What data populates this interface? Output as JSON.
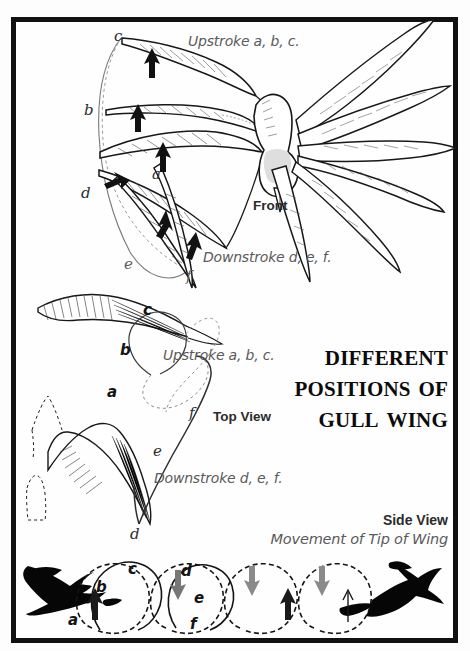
{
  "figure": {
    "title_lines": [
      "Different",
      "Positions of",
      "Gull Wing"
    ],
    "panels": [
      {
        "id": "front",
        "view_label": "Front",
        "upstroke_caption": "Upstroke a, b, c.",
        "downstroke_caption": "Downstroke d, e, f.",
        "markers": [
          "c",
          "b",
          "d",
          "a",
          "e",
          "f"
        ]
      },
      {
        "id": "top",
        "view_label": "Top View",
        "upstroke_caption": "Upstroke a, b, c.",
        "downstroke_caption": "Downstroke d, e, f.",
        "markers": [
          "c",
          "b",
          "a",
          "f",
          "e",
          "d"
        ]
      },
      {
        "id": "side",
        "view_label": "Side View",
        "sub_caption": "Movement of Tip of Wing",
        "markers": [
          "a",
          "b",
          "c",
          "d",
          "e",
          "f"
        ]
      }
    ]
  },
  "labels": {
    "upstroke_top": "Upstroke a, b, c.",
    "downstroke_top": "Downstroke d, e, f.",
    "front": "Front",
    "upstroke_mid": "Upstroke a, b, c.",
    "topview": "Top View",
    "downstroke_mid": "Downstroke d, e, f.",
    "sideview": "Side View",
    "movement": "Movement of Tip of Wing"
  },
  "markers": {
    "p1_c": "c",
    "p1_b": "b",
    "p1_d": "d",
    "p1_a": "a",
    "p1_e": "e",
    "p1_f": "f",
    "p2_c": "c",
    "p2_b": "b",
    "p2_a": "a",
    "p2_f": "f",
    "p2_e": "e",
    "p2_d": "d",
    "p3_a": "a",
    "p3_b": "b",
    "p3_c": "c",
    "p3_d": "d",
    "p3_e": "e",
    "p3_f": "f"
  },
  "colors": {
    "ink": "#111111",
    "paper": "#fefefe",
    "caption": "#555555",
    "trace": "#6b6b6b",
    "silhouette": "#050505"
  }
}
